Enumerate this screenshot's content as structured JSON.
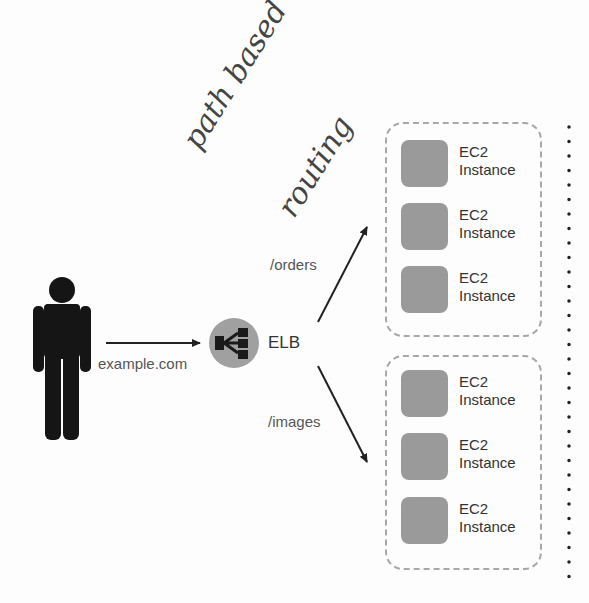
{
  "annotation": {
    "line1": "path based",
    "line2": "routing"
  },
  "user": {
    "icon": "person-icon",
    "request_label": "example.com"
  },
  "load_balancer": {
    "icon": "elb-icon",
    "label": "ELB",
    "color": "#a0a0a0"
  },
  "routes": [
    {
      "path": "/orders"
    },
    {
      "path": "/images"
    }
  ],
  "target_groups": [
    {
      "instances": [
        {
          "line1": "EC2",
          "line2": "Instance"
        },
        {
          "line1": "EC2",
          "line2": "Instance"
        },
        {
          "line1": "EC2",
          "line2": "Instance"
        }
      ]
    },
    {
      "instances": [
        {
          "line1": "EC2",
          "line2": "Instance"
        },
        {
          "line1": "EC2",
          "line2": "Instance"
        },
        {
          "line1": "EC2",
          "line2": "Instance"
        }
      ]
    }
  ],
  "colors": {
    "instance": "#9a9a9a",
    "group_border": "#a8a8a8",
    "arrow": "#222222"
  }
}
